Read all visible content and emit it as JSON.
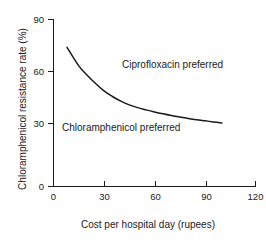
{
  "chart_data": {
    "type": "line",
    "title": "",
    "xlabel": "Cost per hospital day (rupees)",
    "ylabel": "Chloramphenicol resistance rate (%)",
    "xlim": [
      0,
      120
    ],
    "ylim": [
      0,
      90
    ],
    "xticks": [
      0,
      30,
      60,
      90,
      120
    ],
    "yticks": [
      0,
      30,
      60,
      90
    ],
    "xtick_labels": [
      "0",
      "30",
      "60",
      "90",
      "120"
    ],
    "ytick_labels": [
      "0",
      "30",
      "60",
      "90"
    ],
    "grid": false,
    "legend": "none",
    "line_color": "#1a1a1a",
    "series": [
      {
        "name": "Cost-effectiveness threshold",
        "x": [
          8,
          15,
          20,
          25,
          30,
          35,
          40,
          45,
          50,
          55,
          60,
          65,
          70,
          75,
          80,
          85,
          90,
          95,
          100
        ],
        "y": [
          75,
          65,
          60,
          55.5,
          51.5,
          48.5,
          46,
          44,
          42.5,
          41.3,
          40.2,
          39.2,
          38.3,
          37.5,
          36.7,
          36.0,
          35.4,
          34.8,
          34.2
        ]
      }
    ],
    "annotations": [
      {
        "text": "Ciprofloxacin preferred",
        "x": 37,
        "y": 62,
        "region": "above-curve"
      },
      {
        "text": "Chloramphenicol preferred",
        "x": 7,
        "y": 33,
        "region": "below-curve"
      }
    ]
  },
  "axes": {
    "x_title": "Cost per hospital day (rupees)",
    "y_title": "Chloramphenicol resistance rate (%)",
    "x_ticks": [
      {
        "label": "0",
        "px": 53
      },
      {
        "label": "30",
        "px": 104
      },
      {
        "label": "60",
        "px": 155
      },
      {
        "label": "90",
        "px": 206
      },
      {
        "label": "120",
        "px": 256
      }
    ],
    "y_ticks": [
      {
        "label": "90",
        "px": 19
      },
      {
        "label": "60",
        "px": 71
      },
      {
        "label": "30",
        "px": 123
      },
      {
        "label": "0",
        "px": 187
      }
    ]
  },
  "annotations": {
    "ciprofloxacin": "Ciprofloxacin preferred",
    "chloramphenicol": "Chloramphenicol preferred"
  }
}
